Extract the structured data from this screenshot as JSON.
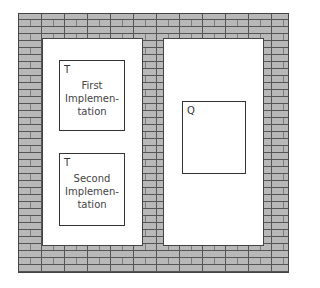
{
  "diagram": {
    "wall": {
      "fill": "#b8b8b8",
      "mortar": "#555555",
      "pattern": "brick"
    },
    "openings": [
      {
        "id": "left",
        "boxes": [
          {
            "tag": "T",
            "label": "First\nImplemen-\ntation"
          },
          {
            "tag": "T",
            "label": "Second\nImplemen-\ntation"
          }
        ]
      },
      {
        "id": "right",
        "boxes": [
          {
            "tag": "Q",
            "label": ""
          }
        ]
      }
    ]
  }
}
